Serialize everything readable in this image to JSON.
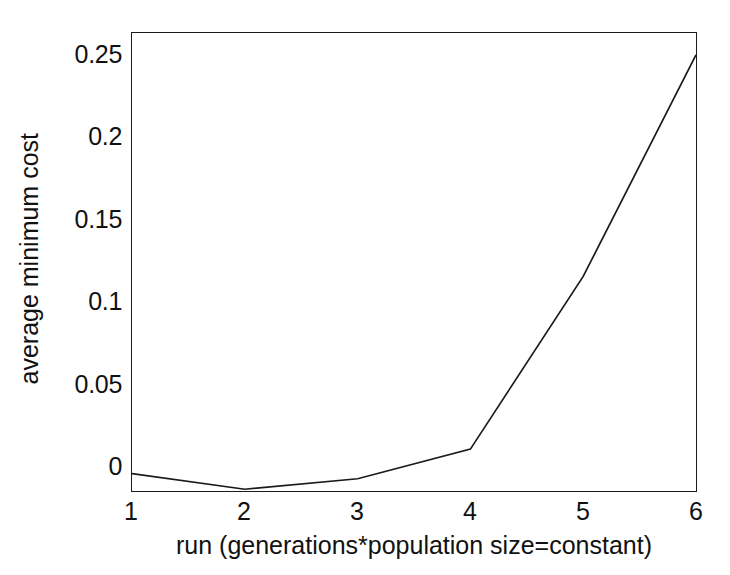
{
  "chart_data": {
    "type": "line",
    "title": "",
    "xlabel": "run (generations*population size=constant)",
    "ylabel": "average minimum cost",
    "x": [
      1,
      2,
      3,
      4,
      5,
      6
    ],
    "values": [
      0.01,
      0.001,
      0.007,
      0.024,
      0.123,
      0.25
    ],
    "series": [
      {
        "name": "average minimum cost",
        "values": [
          0.01,
          0.001,
          0.007,
          0.024,
          0.123,
          0.25
        ]
      }
    ],
    "xlim": [
      1,
      6
    ],
    "ylim": [
      0,
      0.2625
    ],
    "x_ticks": [
      "1",
      "2",
      "3",
      "4",
      "5",
      "6"
    ],
    "y_ticks": [
      "0",
      "0.05",
      "0.1",
      "0.15",
      "0.2",
      "0.25"
    ],
    "x_tick_values": [
      1,
      2,
      3,
      4,
      5,
      6
    ],
    "y_tick_values": [
      0,
      0.05,
      0.1,
      0.15,
      0.2,
      0.25
    ],
    "grid": false,
    "legend": null,
    "legend_position": "none",
    "line_color": "#1a1a1a",
    "axis_color": "#1a1a1a",
    "background_color": "#ffffff",
    "markers": false
  }
}
